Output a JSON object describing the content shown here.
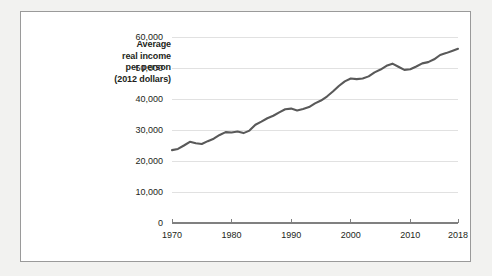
{
  "figure": {
    "background_color": "#f2f2f0",
    "panel_color": "#ffffff",
    "panel_border_color": "#9a9a9a"
  },
  "axis_title": {
    "lines": [
      "Average",
      "real income",
      "per person",
      "(2012 dollars)"
    ]
  },
  "chart_data": {
    "type": "line",
    "title": "",
    "subtitle": "",
    "xlabel": "",
    "ylabel": "Average real income per person (2012 dollars)",
    "grid": true,
    "legend": "none",
    "line_color": "#595959",
    "gridline_color": "#d9d9d9",
    "axis_color": "#808080",
    "xlim": [
      1970,
      2018
    ],
    "ylim": [
      0,
      60000
    ],
    "xticks": [
      1970,
      1980,
      1990,
      2000,
      2010,
      2018
    ],
    "xtick_labels": [
      "1970",
      "1980",
      "1990",
      "2000",
      "2010",
      "2018"
    ],
    "yticks": [
      0,
      10000,
      20000,
      30000,
      40000,
      50000,
      60000
    ],
    "ytick_labels": [
      "0",
      "10,000",
      "20,000",
      "30,000",
      "40,000",
      "50,000",
      "60,000"
    ],
    "series": [
      {
        "name": "Average real income per person (2012 dollars)",
        "x": [
          1970,
          1971,
          1972,
          1973,
          1974,
          1975,
          1976,
          1977,
          1978,
          1979,
          1980,
          1981,
          1982,
          1983,
          1984,
          1985,
          1986,
          1987,
          1988,
          1989,
          1990,
          1991,
          1992,
          1993,
          1994,
          1995,
          1996,
          1997,
          1998,
          1999,
          2000,
          2001,
          2002,
          2003,
          2004,
          2005,
          2006,
          2007,
          2008,
          2009,
          2010,
          2011,
          2012,
          2013,
          2014,
          2015,
          2016,
          2017,
          2018
        ],
        "values": [
          23500,
          23900,
          25000,
          26200,
          25700,
          25500,
          26400,
          27200,
          28400,
          29300,
          29200,
          29500,
          29000,
          29800,
          31700,
          32700,
          33800,
          34600,
          35700,
          36700,
          36900,
          36300,
          36800,
          37400,
          38600,
          39500,
          40800,
          42400,
          44200,
          45700,
          46600,
          46400,
          46600,
          47300,
          48600,
          49500,
          50700,
          51400,
          50400,
          49400,
          49600,
          50500,
          51500,
          51900,
          52800,
          54200,
          54800,
          55500,
          56200
        ]
      }
    ],
    "annotations": []
  }
}
